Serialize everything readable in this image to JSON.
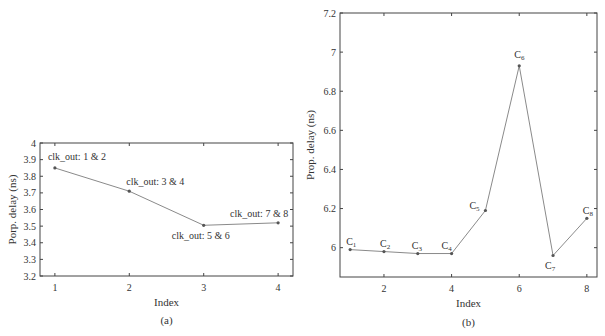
{
  "chart_data": [
    {
      "type": "line",
      "panel": "(a)",
      "title": "",
      "xlabel": "Index",
      "ylabel": "Porp. delay (ns)",
      "x": [
        1,
        2,
        3,
        4
      ],
      "values": [
        3.85,
        3.71,
        3.505,
        3.52
      ],
      "annotations": [
        "clk_out: 1 & 2",
        "clk_out: 3 & 4",
        "clk_out: 5 & 6",
        "clk_out: 7 & 8"
      ],
      "xlim": [
        0.8,
        4.2
      ],
      "ylim": [
        3.2,
        4.0
      ],
      "xticks": [
        "1",
        "2",
        "3",
        "4"
      ],
      "yticks": [
        "3.2",
        "3.3",
        "3.4",
        "3.5",
        "3.6",
        "3.7",
        "3.8",
        "3.9",
        "4"
      ],
      "grid": false,
      "caption": "(a)"
    },
    {
      "type": "line",
      "panel": "(b)",
      "title": "",
      "xlabel": "Index",
      "ylabel": "Prop. delay (ns)",
      "x": [
        1,
        2,
        3,
        4,
        5,
        6,
        7,
        8
      ],
      "values": [
        5.99,
        5.98,
        5.97,
        5.97,
        6.19,
        6.93,
        5.96,
        6.15
      ],
      "annotations": [
        "C1",
        "C2",
        "C3",
        "C4",
        "C5",
        "C6",
        "C7",
        "C8"
      ],
      "xlim": [
        0.7,
        8.3
      ],
      "ylim": [
        5.85,
        7.2
      ],
      "xticks": [
        "2",
        "4",
        "6",
        "8"
      ],
      "yticks": [
        "6",
        "6.2",
        "6.4",
        "6.6",
        "6.8",
        "7",
        "7.2"
      ],
      "grid": false,
      "caption": "(b)"
    }
  ],
  "colors": {
    "line": "#8a8a8a",
    "marker": "#555555",
    "axis": "#444444",
    "text": "#333333"
  }
}
